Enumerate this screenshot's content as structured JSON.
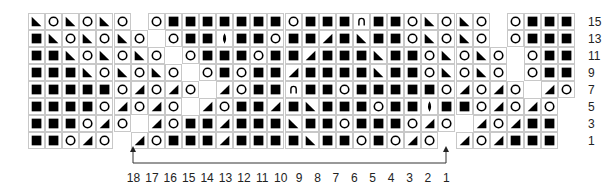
{
  "chart": {
    "legend": {
      "B": "knit-stitch (filled square)",
      "O": "yarn-over (circle)",
      "R": "ssk decrease (left-leaning triangle)",
      "L": "k2tog decrease (right-leaning triangle)",
      "A": "bobble/arch (∩)",
      "D": "double decrease (lens)",
      "_": "no stitch (blank)"
    },
    "row_labels": [
      "15",
      "13",
      "11",
      "9",
      "7",
      "5",
      "3",
      "1"
    ],
    "rows": [
      "RORORO_OBBBBBBBOBBBABBORORO_OBBBBB",
      "BRORORO_OBBDBBOBBLBRBBORORO_OBBBB",
      "BBRORORO_OBBBOBBLBBBRBBORORO_OBBB",
      "BBBRORORO_OBOBBLBBBBRBBORORO_OBB",
      "BBBBBOLOLO_LOBBABBOBBBBBOLOLO_LOL",
      "BBBBOLOLO_LOBBLBRBBBOBBDBBOLOLO_LOLB",
      "BBBOLO_LOBBLBBBRBBOBBBOLO_LOLBB",
      "BBOLO_LOBBBLBBBBRBBOBOLO_LOLBBB"
    ],
    "repeat_label_numbers": [
      "18",
      "17",
      "16",
      "15",
      "14",
      "13",
      "12",
      "11",
      "10",
      "9",
      "8",
      "7",
      "6",
      "5",
      "4",
      "3",
      "2",
      "1"
    ]
  }
}
